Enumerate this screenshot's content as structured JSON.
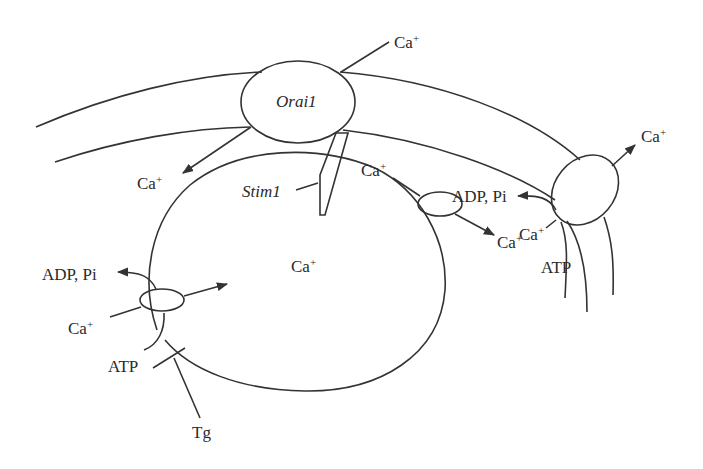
{
  "diagram": {
    "type": "cell-calcium-signaling",
    "colors": {
      "stroke": "#333333",
      "text": "#2a2a2a",
      "background": "#ffffff"
    },
    "labels": {
      "orai1": "Orai1",
      "stim1": "Stim1",
      "ion": "Ca",
      "charge": "+",
      "adp_pi": "ADP, Pi",
      "atp": "ATP",
      "tg": "Tg"
    },
    "nodes": [
      {
        "id": "orai1-channel",
        "label": "Orai1"
      },
      {
        "id": "stim1-sensor",
        "label": "Stim1"
      },
      {
        "id": "er-lumen",
        "label": "Ca+"
      },
      {
        "id": "serca-pump-left",
        "inputs": [
          "Ca+",
          "ATP"
        ],
        "outputs": [
          "ADP, Pi"
        ],
        "inhibitor": "Tg"
      },
      {
        "id": "er-leak-channel",
        "input": "Ca+",
        "output": "Ca+"
      },
      {
        "id": "pmca-pump-right",
        "inputs": [
          "Ca+",
          "ATP"
        ],
        "outputs": [
          "ADP, Pi",
          "Ca+"
        ]
      }
    ]
  }
}
